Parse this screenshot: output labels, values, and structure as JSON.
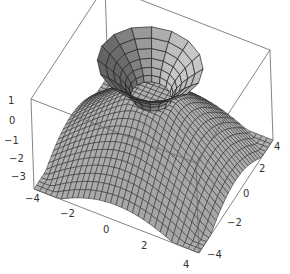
{
  "chart_data": {
    "type": "surface3d",
    "title": "",
    "xlabel": "",
    "ylabel": "",
    "zlabel": "",
    "x_range": [
      -4,
      4
    ],
    "y_range": [
      -4,
      4
    ],
    "z_range": [
      -3.5,
      1
    ],
    "x_ticks": [
      "-4",
      "-2",
      "0",
      "2",
      "4"
    ],
    "y_ticks": [
      "-4",
      "-2",
      "0",
      "2",
      "4"
    ],
    "z_ticks": [
      "1",
      "0",
      "-1",
      "-2",
      "-3"
    ],
    "boxed": true,
    "grid": false,
    "legend": null,
    "series": [
      {
        "name": "dome surface",
        "mesh": "fine",
        "mesh_lines": 30,
        "z_center": 0,
        "z_edge": -3.5,
        "color": "#b8b8b8"
      },
      {
        "name": "flared tube",
        "mesh": "coarse",
        "radial_segments": 16,
        "rings": 6,
        "z_bottom": 0,
        "z_top": 1,
        "color": "#c8c8c8"
      }
    ],
    "colors": {
      "surface": "#bdbdbd",
      "mesh": "#2a2a2a",
      "box": "#555555",
      "text": "#333333"
    }
  },
  "axes": {
    "z_labels": [
      {
        "text": "1",
        "x": 8,
        "y": 104
      },
      {
        "text": "0",
        "x": 9,
        "y": 124
      },
      {
        "text": "−1",
        "x": 4,
        "y": 144
      },
      {
        "text": "−2",
        "x": 9,
        "y": 162
      },
      {
        "text": "−3",
        "x": 11,
        "y": 180
      }
    ],
    "x_labels": [
      {
        "text": "−4",
        "x": 25,
        "y": 202
      },
      {
        "text": "−2",
        "x": 60,
        "y": 217
      },
      {
        "text": "0",
        "x": 103,
        "y": 233
      },
      {
        "text": "2",
        "x": 141,
        "y": 249
      },
      {
        "text": "4",
        "x": 183,
        "y": 268
      }
    ],
    "y_labels": [
      {
        "text": "−4",
        "x": 207,
        "y": 258
      },
      {
        "text": "−2",
        "x": 227,
        "y": 226
      },
      {
        "text": "0",
        "x": 243,
        "y": 197
      },
      {
        "text": "2",
        "x": 259,
        "y": 172
      },
      {
        "text": "4",
        "x": 274,
        "y": 150
      }
    ]
  }
}
